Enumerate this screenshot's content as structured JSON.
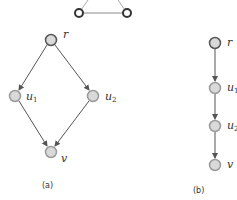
{
  "top_graph": {
    "nodes": [
      {
        "id": "t1",
        "x": 79,
        "y": 13
      },
      {
        "id": "t2",
        "x": 127,
        "y": 13
      }
    ],
    "edges": [
      [
        "t1",
        "t2"
      ]
    ],
    "node_style": "hollow-dark"
  },
  "graph_a": {
    "caption": "(a)",
    "nodes": [
      {
        "id": "r",
        "label": "r",
        "sub": "",
        "x": 51,
        "y": 40
      },
      {
        "id": "u1",
        "label": "u",
        "sub": "1",
        "x": 15,
        "y": 96
      },
      {
        "id": "u2",
        "label": "u",
        "sub": "2",
        "x": 93,
        "y": 96
      },
      {
        "id": "v",
        "label": "v",
        "sub": "",
        "x": 51,
        "y": 152
      }
    ],
    "edges": [
      [
        "r",
        "u1"
      ],
      [
        "r",
        "u2"
      ],
      [
        "u1",
        "v"
      ],
      [
        "u2",
        "v"
      ]
    ]
  },
  "graph_b": {
    "caption": "(b)",
    "nodes": [
      {
        "id": "r",
        "label": "r",
        "sub": "",
        "x": 215,
        "y": 43
      },
      {
        "id": "u1",
        "label": "u",
        "sub": "1",
        "x": 215,
        "y": 88
      },
      {
        "id": "u2",
        "label": "u",
        "sub": "2",
        "x": 215,
        "y": 126
      },
      {
        "id": "v",
        "label": "v",
        "sub": "",
        "x": 215,
        "y": 165
      }
    ],
    "edges": [
      [
        "r",
        "u1"
      ],
      [
        "u1",
        "u2"
      ],
      [
        "u2",
        "v"
      ]
    ]
  },
  "colors": {
    "edge": "#555555",
    "node_fill": "#d9d9d9",
    "node_stroke": "#9a9a9a",
    "root_stroke": "#555555"
  }
}
